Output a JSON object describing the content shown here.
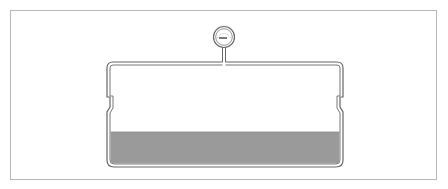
{
  "diagram": {
    "colors": {
      "frame_border": "#b8b8b8",
      "vessel_wall": "#555555",
      "liquid_fill": "#9a9a9a",
      "molecule_stroke": "#444444",
      "molecule_filled": "#333333",
      "arrow": "#444444",
      "background": "#ffffff"
    },
    "gauge": {
      "icon": "pressure-gauge-icon",
      "cx": 224,
      "cy": 37,
      "r": 10
    },
    "vessel": {
      "left": 107,
      "right": 343,
      "top": 61,
      "bottom": 167,
      "liquid_top": 132
    },
    "vapor_molecules": [
      [
        127,
        76
      ],
      [
        169,
        71
      ],
      [
        200,
        79
      ],
      [
        228,
        77
      ],
      [
        259,
        70
      ],
      [
        299,
        79
      ],
      [
        327,
        72
      ],
      [
        123,
        96
      ],
      [
        159,
        90
      ],
      [
        199,
        91
      ],
      [
        248,
        89
      ],
      [
        272,
        96
      ],
      [
        315,
        96
      ],
      [
        227,
        101
      ],
      [
        290,
        104
      ],
      [
        178,
        111
      ],
      [
        328,
        108
      ],
      [
        209,
        117
      ],
      [
        258,
        115
      ],
      [
        124,
        125
      ],
      [
        163,
        124
      ],
      [
        231,
        125
      ],
      [
        321,
        125
      ]
    ],
    "evaporation_arrows": [
      {
        "x": 143,
        "from": 114,
        "to": 130,
        "direction": "down"
      },
      {
        "x": 201,
        "from": 130,
        "to": 119,
        "direction": "up"
      },
      {
        "x": 244,
        "from": 130,
        "to": 118,
        "direction": "up"
      },
      {
        "x": 275,
        "from": 120,
        "to": 131,
        "direction": "down"
      },
      {
        "x": 306,
        "from": 119,
        "to": 131,
        "direction": "down"
      }
    ],
    "bounce_paths": [
      {
        "points": [
          [
            153,
            140
          ],
          [
            162,
            134
          ],
          [
            171,
            140
          ]
        ]
      },
      {
        "points": [
          [
            211,
            140
          ],
          [
            220,
            134
          ],
          [
            229,
            140
          ]
        ]
      },
      {
        "points": [
          [
            286,
            140
          ],
          [
            295,
            134
          ],
          [
            304,
            140
          ]
        ]
      }
    ]
  }
}
